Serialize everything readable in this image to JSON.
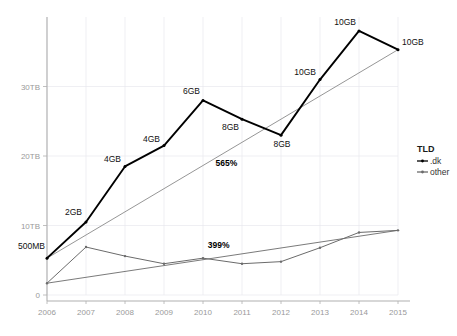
{
  "chart_data": {
    "type": "line",
    "title": "",
    "subtitle": "",
    "xlabel": "",
    "ylabel": "",
    "x": [
      2006,
      2007,
      2008,
      2009,
      2010,
      2011,
      2012,
      2013,
      2014,
      2015
    ],
    "xtick_labels": [
      "2006",
      "2007",
      "2008",
      "2009",
      "2010",
      "2011",
      "2012",
      "2013",
      "2014",
      "2015"
    ],
    "ytick_labels": [
      "0",
      "10TB",
      "20TB",
      "30TB"
    ],
    "ytick_values": [
      0,
      10,
      20,
      30
    ],
    "ylim": [
      0,
      40
    ],
    "xlim": [
      2006,
      2015
    ],
    "y_unit": "TB",
    "grid": true,
    "legend_position": "right",
    "legend_title": "TLD",
    "series": [
      {
        "name": ".dk",
        "color": "#000000",
        "style": "solid-thick-with-points",
        "values": [
          5.3,
          10.5,
          18.5,
          21.5,
          28.0,
          25.3,
          23.0,
          31.0,
          38.0,
          35.3
        ],
        "point_labels": [
          "500MB",
          "2GB",
          "4GB",
          "4GB",
          "6GB",
          "8GB",
          "8GB",
          "10GB",
          "10GB",
          "10GB"
        ]
      },
      {
        "name": "other",
        "color": "#6b6b6b",
        "style": "solid-thin-with-points",
        "values": [
          1.7,
          6.9,
          5.6,
          4.5,
          5.3,
          4.5,
          4.8,
          6.8,
          9.0,
          9.3
        ],
        "point_labels": [
          "",
          "",
          "",
          "",
          "",
          "",
          "",
          "",
          "",
          ""
        ]
      }
    ],
    "trendlines": [
      {
        "name": ".dk-trend",
        "color": "#8a8a8a",
        "from": [
          2006,
          5.3
        ],
        "to": [
          2015,
          35.3
        ],
        "annotation": "565%",
        "annotation_x": 2010.6,
        "annotation_y": 18.6
      },
      {
        "name": "other-trend",
        "color": "#6b6b6b",
        "from": [
          2006,
          1.7
        ],
        "to": [
          2015,
          9.3
        ],
        "annotation": "399%",
        "annotation_x": 2010.4,
        "annotation_y": 6.8
      }
    ],
    "annotations": [
      "565%",
      "399%"
    ]
  },
  "legend": {
    "title": "TLD",
    "entries": [
      {
        "label": ".dk",
        "color": "#000000",
        "marker": "line-with-dot"
      },
      {
        "label": "other",
        "color": "#6b6b6b",
        "marker": "line-with-dot"
      }
    ]
  }
}
